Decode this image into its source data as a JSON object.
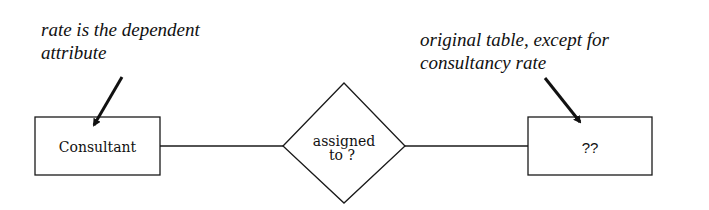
{
  "annotations": {
    "left": "rate is the dependent\nattribute",
    "right": "original table, except for\nconsultancy rate"
  },
  "entities": {
    "left": {
      "label": "Consultant"
    },
    "right": {
      "label": "??"
    }
  },
  "relationship": {
    "line1": "assigned",
    "line2": "to ?"
  },
  "colors": {
    "stroke": "#1a1a1a",
    "background": "#ffffff"
  }
}
